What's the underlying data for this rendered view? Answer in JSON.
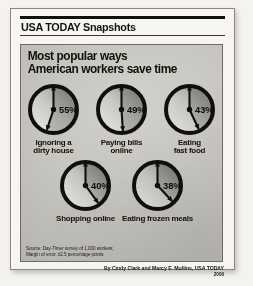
{
  "masthead": {
    "title": "USA TODAY Snapshots"
  },
  "headline": {
    "line1": "Most popular ways",
    "line2": "American workers save time"
  },
  "source": {
    "line1": "Source: Day-Timer survey of 1,000 workers;",
    "line2": "Margin of error: ±2.5 percentage points"
  },
  "byline": {
    "credit": "By Cindy Clark and Marcy E. Mullins, USA TODAY",
    "year": "2006"
  },
  "colors": {
    "ring": "#100f0c",
    "hand": "#100f0c",
    "face_light": "#eae8e3",
    "face_dark": "#8f8d88",
    "panel_bg": "#c8c6c1",
    "text": "#141209"
  },
  "chart_data": {
    "type": "bar",
    "title": "Most popular ways American workers save time",
    "subtitle": "USA TODAY Snapshots",
    "xlabel": "",
    "ylabel": "Percentage of workers",
    "ylim": [
      0,
      100
    ],
    "unit": "%",
    "grid": false,
    "legend": "none",
    "note": "Each value is drawn as a clock face whose shaded wedge and hour-hand angle encode the percentage.",
    "categories": [
      "Ignoring a dirty house",
      "Paying bills online",
      "Eating fast food",
      "Shopping online",
      "Eating frozen meals"
    ],
    "values": [
      55,
      49,
      43,
      40,
      38
    ],
    "source": "Day-Timer survey of 1,000 workers",
    "margin_of_error": "±2.5 percentage points"
  },
  "clocks": [
    {
      "value_label": "55%",
      "value": 55,
      "label": "Ignoring a\ndirty house",
      "name": "clock-ignoring-dirty-house"
    },
    {
      "value_label": "49%",
      "value": 49,
      "label": "Paying bills\nonline",
      "name": "clock-paying-bills-online"
    },
    {
      "value_label": "43%",
      "value": 43,
      "label": "Eating\nfast food",
      "name": "clock-eating-fast-food"
    },
    {
      "value_label": "40%",
      "value": 40,
      "label": "Shopping online",
      "name": "clock-shopping-online"
    },
    {
      "value_label": "38%",
      "value": 38,
      "label": "Eating frozen meals",
      "name": "clock-eating-frozen-meals"
    }
  ]
}
